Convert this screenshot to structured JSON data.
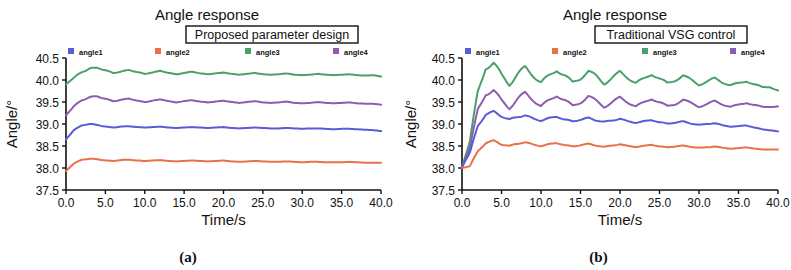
{
  "figure": {
    "panels": [
      {
        "id": "a",
        "caption": "(a)",
        "title": "Angle response",
        "boxed_label": "Traditional VSG control",
        "ylabel": "Angle/°",
        "xlabel": "Time/s"
      },
      {
        "id": "b",
        "caption": "(b)",
        "title": "Angle response",
        "boxed_label": "Traditional VSG control",
        "ylabel": "Angle/°",
        "xlabel": "Time/s"
      }
    ],
    "legend": {
      "entries": [
        {
          "label": "angle1",
          "color": "#5b5bd6"
        },
        {
          "label": "angle2",
          "color": "#e8714a"
        },
        {
          "label": "angle3",
          "color": "#4aa06a"
        },
        {
          "label": "angle4",
          "color": "#8d5bb0"
        }
      ]
    }
  },
  "chart_data": [
    {
      "type": "line",
      "panel": "a",
      "title": "Angle response",
      "annotation": "Proposed parameter design",
      "xlabel": "Time/s",
      "ylabel": "Angle/°",
      "xlim": [
        0.0,
        40.0
      ],
      "ylim": [
        37.5,
        40.5
      ],
      "xticks": [
        "0.0",
        "5.0",
        "10.0",
        "15.0",
        "20.0",
        "25.0",
        "30.0",
        "35.0",
        "40.0"
      ],
      "yticks": [
        "37.5",
        "38.0",
        "38.5",
        "39.0",
        "39.5",
        "40.0",
        "40.5"
      ],
      "grid": false,
      "legend_position": "above-plot",
      "series": [
        {
          "name": "angle3",
          "color": "#4aa06a",
          "start": 39.9,
          "peak": 40.28,
          "peak_time": 2.0,
          "settle": 40.08,
          "osc_amplitude": 0.045,
          "osc_period": 2.0,
          "damping": 0.13,
          "values": [
            39.9,
            40.05,
            40.18,
            40.26,
            40.28,
            40.22,
            40.16,
            40.19,
            40.23,
            40.18,
            40.14,
            40.17,
            40.21,
            40.16,
            40.13,
            40.16,
            40.19,
            40.15,
            40.13,
            40.15,
            40.17,
            40.14,
            40.12,
            40.14,
            40.16,
            40.13,
            40.12,
            40.13,
            40.15,
            40.12,
            40.11,
            40.12,
            40.14,
            40.12,
            40.11,
            40.12,
            40.13,
            40.11,
            40.1,
            40.11,
            40.08
          ]
        },
        {
          "name": "angle4",
          "color": "#8d5bb0",
          "start": 39.2,
          "peak": 39.63,
          "peak_time": 2.0,
          "settle": 39.44,
          "osc_amplitude": 0.04,
          "osc_period": 2.0,
          "damping": 0.13,
          "values": [
            39.2,
            39.4,
            39.54,
            39.61,
            39.63,
            39.57,
            39.52,
            39.55,
            39.58,
            39.53,
            39.5,
            39.53,
            39.56,
            39.52,
            39.49,
            39.52,
            39.54,
            39.51,
            39.49,
            39.51,
            39.53,
            39.5,
            39.48,
            39.5,
            39.52,
            39.49,
            39.48,
            39.49,
            39.51,
            39.48,
            39.47,
            39.48,
            39.5,
            39.48,
            39.47,
            39.48,
            39.49,
            39.47,
            39.46,
            39.46,
            39.44
          ]
        },
        {
          "name": "angle1",
          "color": "#5b5bd6",
          "start": 38.65,
          "peak": 39.0,
          "peak_time": 1.8,
          "settle": 38.84,
          "osc_amplitude": 0.02,
          "osc_period": 2.0,
          "damping": 0.15,
          "values": [
            38.65,
            38.86,
            38.97,
            39.0,
            38.98,
            38.94,
            38.92,
            38.94,
            38.95,
            38.93,
            38.92,
            38.93,
            38.94,
            38.92,
            38.91,
            38.92,
            38.93,
            38.92,
            38.91,
            38.92,
            38.93,
            38.91,
            38.9,
            38.91,
            38.92,
            38.91,
            38.9,
            38.9,
            38.91,
            38.9,
            38.89,
            38.9,
            38.9,
            38.89,
            38.88,
            38.89,
            38.89,
            38.88,
            38.87,
            38.86,
            38.84
          ]
        },
        {
          "name": "angle2",
          "color": "#e8714a",
          "start": 37.93,
          "peak": 38.21,
          "peak_time": 1.8,
          "settle": 38.12,
          "osc_amplitude": 0.015,
          "osc_period": 2.0,
          "damping": 0.15,
          "values": [
            37.93,
            38.1,
            38.19,
            38.21,
            38.2,
            38.17,
            38.16,
            38.18,
            38.19,
            38.17,
            38.16,
            38.17,
            38.18,
            38.16,
            38.15,
            38.16,
            38.17,
            38.16,
            38.15,
            38.16,
            38.17,
            38.15,
            38.14,
            38.15,
            38.16,
            38.15,
            38.14,
            38.14,
            38.15,
            38.14,
            38.13,
            38.14,
            38.14,
            38.13,
            38.13,
            38.13,
            38.14,
            38.13,
            38.12,
            38.12,
            38.12
          ]
        }
      ]
    },
    {
      "type": "line",
      "panel": "b",
      "title": "Angle response",
      "annotation": "Traditional VSG control",
      "xlabel": "Time/s",
      "ylabel": "Angle/°",
      "xlim": [
        0.0,
        40.0
      ],
      "ylim": [
        37.5,
        40.5
      ],
      "xticks": [
        "0.0",
        "5.0",
        "10.0",
        "15.0",
        "20.0",
        "25.0",
        "30.0",
        "35.0",
        "40.0"
      ],
      "yticks": [
        "37.5",
        "38.0",
        "38.5",
        "39.0",
        "39.5",
        "40.0",
        "40.5"
      ],
      "grid": false,
      "legend_position": "above-plot",
      "series": [
        {
          "name": "angle3",
          "color": "#4aa06a",
          "start": 38.02,
          "peak": 40.38,
          "peak_time": 2.4,
          "settle": 39.76,
          "osc_amplitude": 0.22,
          "osc_period": 3.0,
          "damping": 0.035,
          "values": [
            38.02,
            38.6,
            39.7,
            40.3,
            40.38,
            40.1,
            39.92,
            40.12,
            40.28,
            40.12,
            39.94,
            40.08,
            40.24,
            40.1,
            39.93,
            40.05,
            40.2,
            40.08,
            39.93,
            40.04,
            40.18,
            40.06,
            39.93,
            40.02,
            40.14,
            40.03,
            39.92,
            40.0,
            40.1,
            40.0,
            39.9,
            39.96,
            40.04,
            39.95,
            39.88,
            39.92,
            39.98,
            39.9,
            39.83,
            39.85,
            39.76
          ]
        },
        {
          "name": "angle4",
          "color": "#8d5bb0",
          "start": 38.02,
          "peak": 39.76,
          "peak_time": 2.4,
          "settle": 39.4,
          "osc_amplitude": 0.18,
          "osc_period": 3.0,
          "damping": 0.035,
          "values": [
            38.02,
            38.45,
            39.3,
            39.7,
            39.76,
            39.52,
            39.38,
            39.56,
            39.7,
            39.56,
            39.4,
            39.52,
            39.66,
            39.54,
            39.4,
            39.5,
            39.63,
            39.52,
            39.4,
            39.49,
            39.6,
            39.5,
            39.4,
            39.48,
            39.58,
            39.49,
            39.4,
            39.46,
            39.55,
            39.47,
            39.4,
            39.45,
            39.52,
            39.45,
            39.39,
            39.43,
            39.49,
            39.43,
            39.38,
            39.4,
            39.4
          ]
        },
        {
          "name": "angle1",
          "color": "#5b5bd6",
          "start": 38.02,
          "peak": 39.28,
          "peak_time": 2.5,
          "settle": 38.83,
          "osc_amplitude": 0.07,
          "osc_period": 2.4,
          "damping": 0.05,
          "values": [
            38.02,
            38.35,
            38.95,
            39.22,
            39.28,
            39.18,
            39.1,
            39.16,
            39.2,
            39.12,
            39.08,
            39.13,
            39.17,
            39.1,
            39.06,
            39.1,
            39.14,
            39.08,
            39.05,
            39.08,
            39.12,
            39.06,
            39.03,
            39.06,
            39.09,
            39.04,
            39.01,
            39.03,
            39.06,
            39.01,
            38.98,
            39.0,
            39.02,
            38.97,
            38.94,
            38.95,
            38.97,
            38.92,
            38.88,
            38.86,
            38.83
          ]
        },
        {
          "name": "angle2",
          "color": "#e8714a",
          "start": 38.0,
          "peak": 38.62,
          "peak_time": 2.6,
          "settle": 38.42,
          "osc_amplitude": 0.045,
          "osc_period": 2.4,
          "damping": 0.05,
          "values": [
            38.0,
            38.04,
            38.38,
            38.57,
            38.62,
            38.54,
            38.5,
            38.55,
            38.59,
            38.53,
            38.5,
            38.54,
            38.57,
            38.52,
            38.49,
            38.52,
            38.55,
            38.51,
            38.48,
            38.51,
            38.54,
            38.5,
            38.48,
            38.5,
            38.53,
            38.49,
            38.47,
            38.49,
            38.51,
            38.48,
            38.46,
            38.47,
            38.49,
            38.46,
            38.44,
            38.45,
            38.47,
            38.44,
            38.42,
            38.42,
            38.42
          ]
        }
      ]
    }
  ]
}
